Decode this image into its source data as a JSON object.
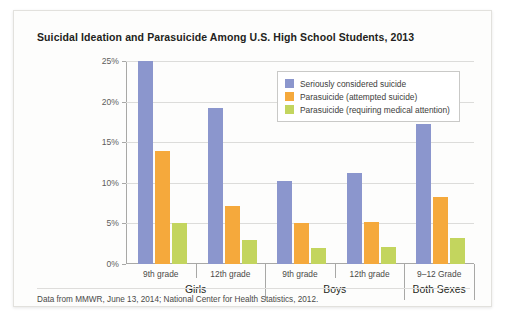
{
  "chart_data": {
    "type": "bar",
    "title": "Suicidal Ideation and Parasuicide Among U.S. High School Students, 2013",
    "xlabel": "",
    "ylabel": "",
    "ylim": [
      0,
      25
    ],
    "ytick_labels": [
      "0%",
      "5%",
      "10%",
      "15%",
      "20%",
      "25%"
    ],
    "ytick_values": [
      0,
      5,
      10,
      15,
      20,
      25
    ],
    "grid": true,
    "legend_position": "top-right-inside",
    "categories": [
      "9th grade",
      "12th grade",
      "9th grade",
      "12th grade",
      "9–12 Grade"
    ],
    "groups": [
      {
        "label": "Girls",
        "categories": [
          "9th grade",
          "12th grade"
        ]
      },
      {
        "label": "Boys",
        "categories": [
          "9th grade",
          "12th grade"
        ]
      },
      {
        "label": "Both Sexes",
        "categories": [
          "9–12 Grade"
        ]
      }
    ],
    "series": [
      {
        "name": "Seriously considered suicide",
        "color": "#8b96cd",
        "values": [
          25.0,
          19.2,
          10.2,
          11.2,
          17.2
        ]
      },
      {
        "name": "Parasuicide (attempted suicide)",
        "color": "#f5a93c",
        "values": [
          13.9,
          7.1,
          5.1,
          5.2,
          8.2
        ]
      },
      {
        "name": "Parasuicide (requiring medical attention)",
        "color": "#c3d55e",
        "values": [
          5.0,
          2.9,
          2.0,
          2.1,
          3.2
        ]
      }
    ],
    "source_note": "Data from MMWR, June 13, 2014; National Center for Health Statistics, 2012."
  }
}
